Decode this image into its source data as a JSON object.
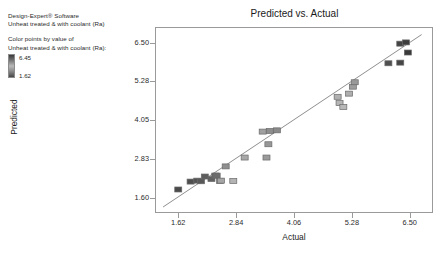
{
  "software_info": {
    "line1": "Design-Expert® Software",
    "line2": "Unheat treated  & with coolant (Ra)"
  },
  "color_legend": {
    "caption1": "Color points by value of",
    "caption2": "Unheat treated  & with coolant (Ra):",
    "max": "6.45",
    "min": "1.62",
    "gradient_dark": "#3a3a3a",
    "gradient_light": "#b9b9b9"
  },
  "chart_data": {
    "type": "scatter",
    "title": "Predicted vs. Actual",
    "xlabel": "Actual",
    "ylabel": "Predicted",
    "xlim": [
      1.13,
      6.99
    ],
    "ylim": [
      1.11,
      6.99
    ],
    "xticks": [
      "1.62",
      "2.84",
      "4.06",
      "5.28",
      "6.50"
    ],
    "xtick_values": [
      1.62,
      2.84,
      4.06,
      5.28,
      6.5
    ],
    "yticks": [
      "1.60",
      "2.83",
      "4.05",
      "5.28",
      "6.50"
    ],
    "ytick_values": [
      1.6,
      2.83,
      4.05,
      5.28,
      6.5
    ],
    "grid": false,
    "legend": "none",
    "reference_line": {
      "label": "y = x identity line",
      "from": [
        1.3,
        1.3
      ],
      "to": [
        6.75,
        6.75
      ],
      "color": "#8f8f8f"
    },
    "marker": {
      "shape": "square",
      "size_px": 7,
      "edge_color": "#6a6a6a"
    },
    "points": [
      {
        "x": 1.62,
        "y": 1.79,
        "color": "#4a4a4a"
      },
      {
        "x": 1.88,
        "y": 2.04,
        "color": "#4e4e4e"
      },
      {
        "x": 2.02,
        "y": 2.07,
        "color": "#545454"
      },
      {
        "x": 2.1,
        "y": 2.05,
        "color": "#585858"
      },
      {
        "x": 2.18,
        "y": 2.2,
        "color": "#5d5d5d"
      },
      {
        "x": 2.32,
        "y": 2.12,
        "color": "#616161"
      },
      {
        "x": 2.4,
        "y": 2.23,
        "color": "#686868"
      },
      {
        "x": 2.43,
        "y": 2.23,
        "color": "#6d6d6d"
      },
      {
        "x": 2.5,
        "y": 2.06,
        "color": "#9e9e9e"
      },
      {
        "x": 2.52,
        "y": 2.07,
        "color": "#a6a6a6"
      },
      {
        "x": 2.62,
        "y": 2.52,
        "color": "#8f8f8f"
      },
      {
        "x": 2.78,
        "y": 2.06,
        "color": "#b3b3b3"
      },
      {
        "x": 3.02,
        "y": 2.8,
        "color": "#a8a8a8"
      },
      {
        "x": 3.48,
        "y": 2.8,
        "color": "#9b9b9b"
      },
      {
        "x": 3.52,
        "y": 3.22,
        "color": "#979797"
      },
      {
        "x": 3.4,
        "y": 3.62,
        "color": "#a0a0a0"
      },
      {
        "x": 3.55,
        "y": 3.64,
        "color": "#8d8d8d"
      },
      {
        "x": 3.7,
        "y": 3.66,
        "color": "#8a8a8a"
      },
      {
        "x": 4.98,
        "y": 4.72,
        "color": "#b0b0b0"
      },
      {
        "x": 5.02,
        "y": 4.52,
        "color": "#b5b5b5"
      },
      {
        "x": 5.1,
        "y": 4.4,
        "color": "#b8b8b8"
      },
      {
        "x": 5.22,
        "y": 4.82,
        "color": "#aeaeae"
      },
      {
        "x": 5.3,
        "y": 5.04,
        "color": "#9d9d9d"
      },
      {
        "x": 5.34,
        "y": 5.18,
        "color": "#999999"
      },
      {
        "x": 6.05,
        "y": 5.78,
        "color": "#4f4f4f"
      },
      {
        "x": 6.3,
        "y": 6.4,
        "color": "#434343"
      },
      {
        "x": 6.42,
        "y": 6.44,
        "color": "#3d3d3d"
      },
      {
        "x": 6.46,
        "y": 6.12,
        "color": "#3a3a3a"
      },
      {
        "x": 6.3,
        "y": 5.8,
        "color": "#454545"
      }
    ]
  }
}
